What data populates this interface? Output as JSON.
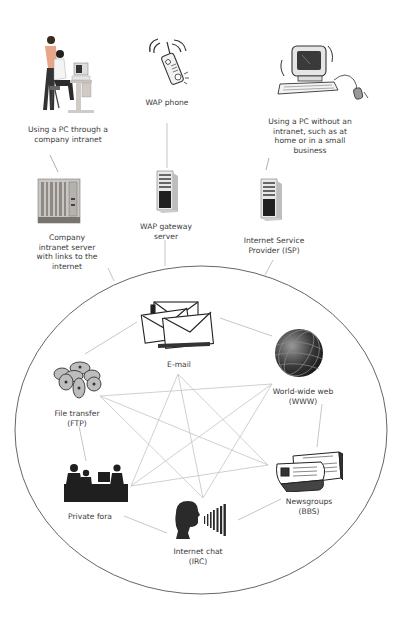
{
  "diagram": {
    "colors": {
      "background": "#ffffff",
      "ellipse_stroke": "#555555",
      "connector": "#b5b5b5",
      "star_line": "#c0c0c0",
      "label_text": "#3a3a3a",
      "icon_dark": "#2a2a2a"
    },
    "access_devices": [
      {
        "id": "intranet-pc",
        "label": "Using a PC through a\ncompany intranet",
        "icon": "office-workers-pc-icon"
      },
      {
        "id": "wap-phone",
        "label": "WAP phone",
        "icon": "mobile-phone-icon"
      },
      {
        "id": "home-pc",
        "label": "Using a PC without an\nintranet, such as at\nhome or in a small\nbusiness",
        "icon": "desktop-computer-icon"
      }
    ],
    "gateways": [
      {
        "id": "intranet-server",
        "label": "Company\nintranet server\nwith links to the\ninternet",
        "icon": "rack-server-icon"
      },
      {
        "id": "wap-gateway",
        "label": "WAP gateway\nserver",
        "icon": "tower-server-icon"
      },
      {
        "id": "isp",
        "label": "Internet Service\nProvider (ISP)",
        "icon": "tower-server-icon"
      }
    ],
    "internet_services": [
      {
        "id": "email",
        "label": "E-mail",
        "icon": "envelopes-icon"
      },
      {
        "id": "www",
        "label": "World-wide web\n(WWW)",
        "icon": "globe-icon"
      },
      {
        "id": "bbs",
        "label": "Newsgroups\n(BBS)",
        "icon": "newspapers-icon"
      },
      {
        "id": "irc",
        "label": "Internet chat\n(IRC)",
        "icon": "speaking-head-icon"
      },
      {
        "id": "fora",
        "label": "Private fora",
        "icon": "meeting-silhouette-icon"
      },
      {
        "id": "ftp",
        "label": "File transfer\n(FTP)",
        "icon": "disks-icon"
      }
    ],
    "connections": {
      "device_to_gateway": [
        [
          "intranet-pc",
          "intranet-server"
        ],
        [
          "wap-phone",
          "wap-gateway"
        ],
        [
          "home-pc",
          "isp"
        ]
      ],
      "gateway_to_internet": [
        "intranet-server",
        "wap-gateway",
        "isp"
      ],
      "ring": [
        [
          "email",
          "www"
        ],
        [
          "www",
          "bbs"
        ],
        [
          "bbs",
          "irc"
        ],
        [
          "irc",
          "fora"
        ],
        [
          "fora",
          "ftp"
        ],
        [
          "ftp",
          "email"
        ]
      ],
      "star": [
        [
          "email",
          "bbs"
        ],
        [
          "email",
          "fora"
        ],
        [
          "www",
          "fora"
        ],
        [
          "www",
          "ftp"
        ],
        [
          "bbs",
          "ftp"
        ],
        [
          "irc",
          "email"
        ],
        [
          "irc",
          "www"
        ],
        [
          "irc",
          "ftp"
        ],
        [
          "fora",
          "bbs"
        ]
      ]
    }
  }
}
